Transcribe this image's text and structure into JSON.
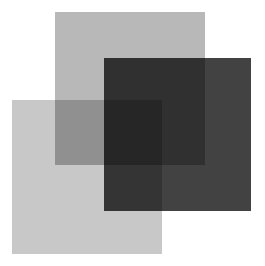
{
  "diagram": {
    "type": "overlapping-squares",
    "blend": "multiply",
    "squares": [
      {
        "id": "top",
        "label": "",
        "color": "#b8b8b8",
        "x": 55,
        "y": 12,
        "width": 150,
        "height": 153
      },
      {
        "id": "dark",
        "label": "",
        "color": "#424242",
        "x": 104,
        "y": 58,
        "width": 147,
        "height": 153
      },
      {
        "id": "bottom",
        "label": "",
        "color": "#c8c8c8",
        "x": 12,
        "y": 100,
        "width": 150,
        "height": 154
      }
    ]
  }
}
